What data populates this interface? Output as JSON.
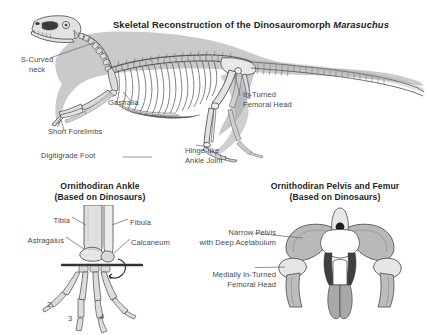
{
  "figure": {
    "background_color": "#ffffff",
    "bone_fill": "#dcdcdc",
    "bone_outline": "#58595b",
    "silhouette_fill": "#a7a9ac",
    "dark_fill": "#4d4d4d",
    "text_color": "#4a4a4a",
    "title_color": "#231f20",
    "leader_color": "#6d6e71"
  },
  "main_panel": {
    "title_prefix": "Skeletal Reconstruction of the Dinosauromorph ",
    "title_taxon": "Marasuchus",
    "labels": [
      {
        "name": "s-curved-neck",
        "text": "S-Curved\nneck"
      },
      {
        "name": "gastralia",
        "text": "Gastralia"
      },
      {
        "name": "short-forelimbs",
        "text": "Short Forelimbs"
      },
      {
        "name": "digitigrade-foot",
        "text": "Digitigrade Foot"
      },
      {
        "name": "in-turned-femoral-head",
        "text": "In-Turned\nFemoral Head"
      },
      {
        "name": "hinge-like-ankle-joint",
        "text": "Hinge-like\nAnkle Joint"
      }
    ]
  },
  "ankle_panel": {
    "title": "Ornithodiran Ankle\n(Based on Dinosaurs)",
    "labels": [
      {
        "name": "tibia",
        "text": "Tibia"
      },
      {
        "name": "fibula",
        "text": "Fibula"
      },
      {
        "name": "astragalus",
        "text": "Astragalus"
      },
      {
        "name": "calcaneum",
        "text": "Calcaneum"
      }
    ],
    "digits": [
      {
        "name": "digit-2",
        "text": "2"
      },
      {
        "name": "digit-3",
        "text": "3"
      },
      {
        "name": "digit-4",
        "text": "4"
      }
    ]
  },
  "pelvis_panel": {
    "title": "Ornithodiran Pelvis and Femur\n(Based on Dinosaurs)",
    "labels": [
      {
        "name": "narrow-pelvis",
        "text": "Narrow Pelvis\nwith Deep Acetabulum"
      },
      {
        "name": "medially-in-turned-femoral-head",
        "text": "Medially In-Turned\nFemoral Head"
      }
    ]
  }
}
